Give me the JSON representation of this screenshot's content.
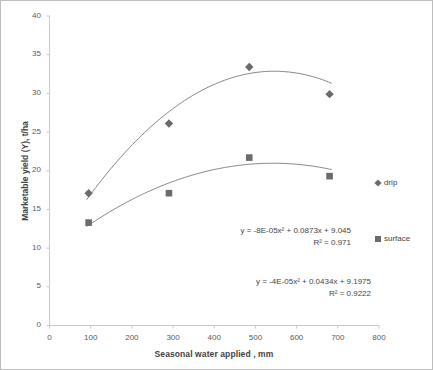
{
  "chart_data": {
    "type": "scatter",
    "title": "",
    "xlabel": "Seasonal water applied , mm",
    "ylabel": "Marketable yield (Y), t/ha",
    "xlim": [
      0,
      800
    ],
    "ylim": [
      0,
      40
    ],
    "xticks": [
      0,
      100,
      200,
      300,
      400,
      500,
      600,
      700,
      800
    ],
    "yticks": [
      0,
      5,
      10,
      15,
      20,
      25,
      30,
      35,
      40
    ],
    "grid": false,
    "legend_position": "right",
    "marker_color": "#6b6b6b",
    "trendline_color": "#7a7a7a",
    "x": [
      95,
      290,
      485,
      680
    ],
    "series": [
      {
        "name": "drip",
        "marker": "diamond",
        "values": [
          17.1,
          26.1,
          33.4,
          29.9
        ],
        "trendline": {
          "equation": "y = -8E-05x² + 0.0873x + 9.045",
          "r2": "R² = 0.971",
          "a": -8e-05,
          "b": 0.0873,
          "c": 9.045
        }
      },
      {
        "name": "surface",
        "marker": "square",
        "values": [
          13.3,
          17.1,
          21.7,
          19.3
        ],
        "trendline": {
          "equation": "y = -4E-05x² + 0.0434x + 9.1975",
          "r2": "R² = 0.9222",
          "a": -4e-05,
          "b": 0.0434,
          "c": 9.1975
        }
      }
    ]
  },
  "axes": {
    "x_title": "Seasonal water applied , mm",
    "y_title": "Marketable yield (Y), t/ha",
    "x_tick_labels": [
      "0",
      "100",
      "200",
      "300",
      "400",
      "500",
      "600",
      "700",
      "800"
    ],
    "y_tick_labels": [
      "0",
      "5",
      "10",
      "15",
      "20",
      "25",
      "30",
      "35",
      "40"
    ]
  },
  "annotations": {
    "drip_equation": "y = -8E-05x² + 0.0873x + 9.045",
    "drip_r2": "R² = 0.971",
    "surface_equation": "y = -4E-05x² + 0.0434x + 9.1975",
    "surface_r2": "R² = 0.9222"
  },
  "legend": {
    "items": [
      {
        "label": "drip",
        "marker": "diamond"
      },
      {
        "label": "surface",
        "marker": "square"
      }
    ]
  }
}
